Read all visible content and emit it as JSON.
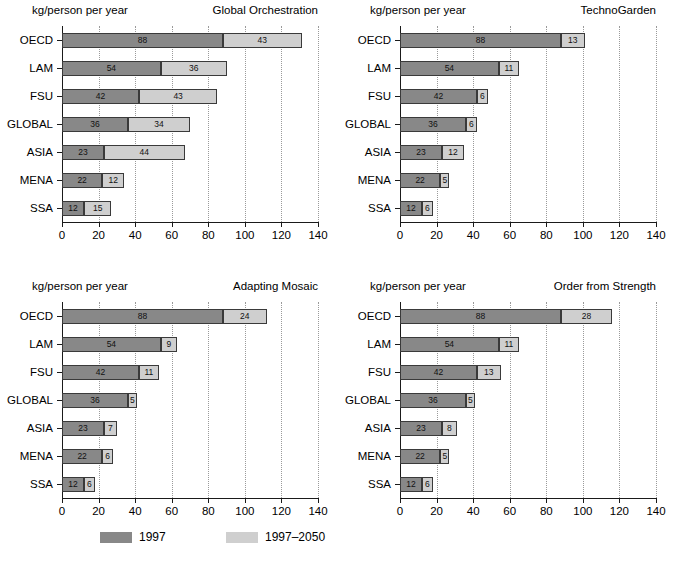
{
  "figure": {
    "unit_label": "kg/person per year",
    "legend": [
      {
        "label": "1997",
        "color": "#888888",
        "key": "a"
      },
      {
        "label": "1997–2050",
        "color": "#cfcfcf",
        "key": "b"
      }
    ]
  },
  "chart_data": [
    {
      "type": "bar",
      "orientation": "horizontal",
      "stacked": true,
      "title": "Global Orchestration",
      "xlabel": "kg/person per year",
      "ylabel": "",
      "xlim": [
        0,
        140
      ],
      "xticks": [
        0,
        20,
        40,
        60,
        80,
        100,
        120,
        140
      ],
      "grid": "vertical-dotted",
      "legend_position": "figure-bottom",
      "categories": [
        "OECD",
        "LAM",
        "FSU",
        "GLOBAL",
        "ASIA",
        "MENA",
        "SSA"
      ],
      "series": [
        {
          "name": "1997",
          "color": "#888888",
          "values": [
            88,
            54,
            42,
            36,
            23,
            22,
            12
          ]
        },
        {
          "name": "1997–2050",
          "color": "#cfcfcf",
          "values": [
            43,
            36,
            43,
            34,
            44,
            12,
            15
          ]
        }
      ]
    },
    {
      "type": "bar",
      "orientation": "horizontal",
      "stacked": true,
      "title": "TechnoGarden",
      "xlabel": "kg/person per year",
      "ylabel": "",
      "xlim": [
        0,
        140
      ],
      "xticks": [
        0,
        20,
        40,
        60,
        80,
        100,
        120,
        140
      ],
      "grid": "vertical-dotted",
      "legend_position": "figure-bottom",
      "categories": [
        "OECD",
        "LAM",
        "FSU",
        "GLOBAL",
        "ASIA",
        "MENA",
        "SSA"
      ],
      "series": [
        {
          "name": "1997",
          "color": "#888888",
          "values": [
            88,
            54,
            42,
            36,
            23,
            22,
            12
          ]
        },
        {
          "name": "1997–2050",
          "color": "#cfcfcf",
          "values": [
            13,
            11,
            6,
            6,
            12,
            5,
            6
          ]
        }
      ]
    },
    {
      "type": "bar",
      "orientation": "horizontal",
      "stacked": true,
      "title": "Adapting Mosaic",
      "xlabel": "kg/person per year",
      "ylabel": "",
      "xlim": [
        0,
        140
      ],
      "xticks": [
        0,
        20,
        40,
        60,
        80,
        100,
        120,
        140
      ],
      "grid": "vertical-dotted",
      "legend_position": "figure-bottom",
      "categories": [
        "OECD",
        "LAM",
        "FSU",
        "GLOBAL",
        "ASIA",
        "MENA",
        "SSA"
      ],
      "series": [
        {
          "name": "1997",
          "color": "#888888",
          "values": [
            88,
            54,
            42,
            36,
            23,
            22,
            12
          ]
        },
        {
          "name": "1997–2050",
          "color": "#cfcfcf",
          "values": [
            24,
            9,
            11,
            5,
            7,
            6,
            6
          ]
        }
      ]
    },
    {
      "type": "bar",
      "orientation": "horizontal",
      "stacked": true,
      "title": "Order from Strength",
      "xlabel": "kg/person per year",
      "ylabel": "",
      "xlim": [
        0,
        140
      ],
      "xticks": [
        0,
        20,
        40,
        60,
        80,
        100,
        120,
        140
      ],
      "grid": "vertical-dotted",
      "legend_position": "figure-bottom",
      "categories": [
        "OECD",
        "LAM",
        "FSU",
        "GLOBAL",
        "ASIA",
        "MENA",
        "SSA"
      ],
      "series": [
        {
          "name": "1997",
          "color": "#888888",
          "values": [
            88,
            54,
            42,
            36,
            23,
            22,
            12
          ]
        },
        {
          "name": "1997–2050",
          "color": "#cfcfcf",
          "values": [
            28,
            11,
            13,
            5,
            8,
            5,
            6
          ]
        }
      ]
    }
  ]
}
